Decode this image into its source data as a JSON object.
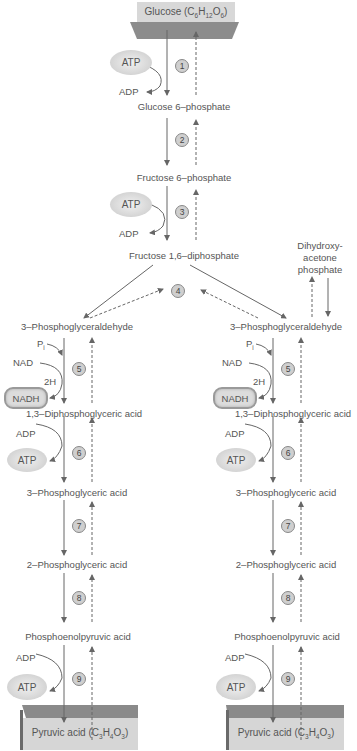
{
  "colors": {
    "arrow": "#666666",
    "box_light": "#d6d6d6",
    "box_dark": "#8f8f8f",
    "pill": "#d4d4d4"
  },
  "top_box": {
    "label": "Glucose (C",
    "sub1": "6",
    "mid1": "H",
    "sub2": "12",
    "mid2": "O",
    "sub3": "6",
    "end": ")"
  },
  "center": {
    "atp1": "ATP",
    "adp1": "ADP",
    "step1": "1",
    "g6p": "Glucose 6–phosphate",
    "step2": "2",
    "f6p": "Fructose 6–phosphate",
    "atp3": "ATP",
    "adp3": "ADP",
    "step3": "3",
    "f16": "Fructose 1,6–diphosphate",
    "step4": "4"
  },
  "dhap": {
    "line1": "Dihydroxy-",
    "line2": "acetone",
    "line3": "phosphate"
  },
  "left": {
    "g3p": "3–Phosphoglyceraldehyde",
    "pi": "P",
    "pi_sub": "i",
    "nad": "NAD",
    "h2": "2H",
    "nadh": "NADH",
    "step5": "5",
    "bpg": "1,3–Diphosphoglyceric acid",
    "adp6": "ADP",
    "atp6": "ATP",
    "step6": "6",
    "pg3": "3–Phosphoglyceric acid",
    "step7": "7",
    "pg2": "2–Phosphoglyceric acid",
    "step8": "8",
    "pep": "Phosphoenolpyruvic acid",
    "adp9": "ADP",
    "atp9": "ATP",
    "step9": "9",
    "pyruvate": {
      "label": "Pyruvic acid (C",
      "sub1": "3",
      "mid1": "H",
      "sub2": "4",
      "mid2": "O",
      "sub3": "3",
      "end": ")"
    }
  },
  "right": {
    "g3p": "3–Phosphoglyceraldehyde",
    "pi": "P",
    "pi_sub": "i",
    "nad": "NAD",
    "h2": "2H",
    "nadh": "NADH",
    "step5": "5",
    "bpg": "1,3–Diphosphoglyceric acid",
    "adp6": "ADP",
    "atp6": "ATP",
    "step6": "6",
    "pg3": "3–Phosphoglyceric acid",
    "step7": "7",
    "pg2": "2–Phosphoglyceric acid",
    "step8": "8",
    "pep": "Phosphoenolpyruvic acid",
    "adp9": "ADP",
    "atp9": "ATP",
    "step9": "9",
    "pyruvate": {
      "label": "Pyruvic acid (C",
      "sub1": "3",
      "mid1": "H",
      "sub2": "4",
      "mid2": "O",
      "sub3": "3",
      "end": ")"
    }
  }
}
